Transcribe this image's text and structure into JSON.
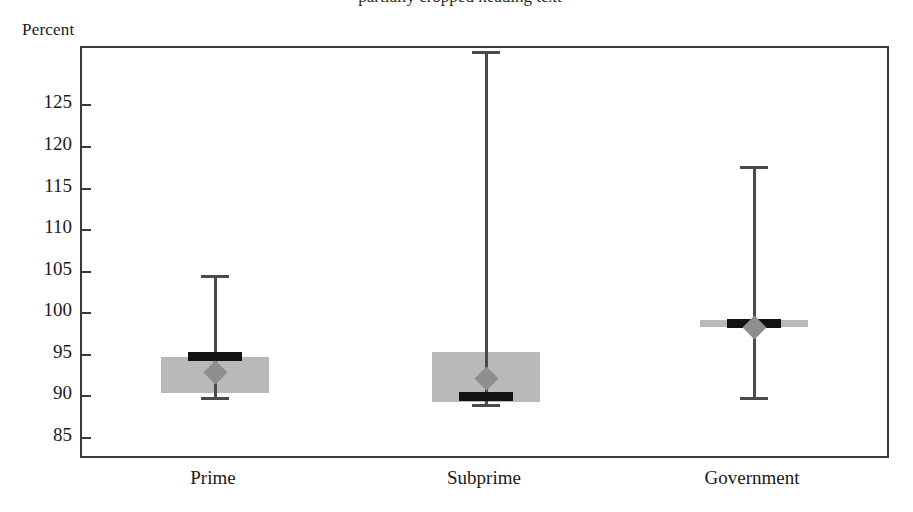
{
  "figure": {
    "title_remnant": "partially cropped heading text",
    "y_unit_label": "Percent"
  },
  "chart_data": {
    "type": "box",
    "title": "",
    "subtitle": "",
    "xlabel": "",
    "ylabel": "Percent",
    "ylim": [
      82.2,
      131.8
    ],
    "yticks": [
      85,
      90,
      95,
      100,
      105,
      110,
      115,
      120,
      125
    ],
    "ytick_labels": [
      "85",
      "90",
      "95",
      "100",
      "105",
      "110",
      "115",
      "120",
      "125"
    ],
    "grid": false,
    "legend": null,
    "categories": [
      "Prime",
      "Subprime",
      "Government"
    ],
    "box_fill_color": "#b9b9b9",
    "median_color": "#121212",
    "mean_marker_color": "#8e8e8e",
    "mean_marker_shape": "diamond",
    "whisker_color": "#4a4a4a",
    "frame_color": "#3a3a3a",
    "series": [
      {
        "name": "Prime",
        "whisker_low": 89.8,
        "box_low": 90.3,
        "median": 94.7,
        "box_high": 94.6,
        "whisker_high": 104.5,
        "mean": 92.7
      },
      {
        "name": "Subprime",
        "whisker_low": 89.0,
        "box_low": 89.2,
        "median": 89.9,
        "box_high": 95.2,
        "whisker_high": 131.4,
        "mean": 92.0
      },
      {
        "name": "Government",
        "whisker_low": 89.8,
        "box_low": 98.2,
        "median": 98.6,
        "box_high": 99.0,
        "whisker_high": 117.6,
        "mean": 98.2
      }
    ]
  }
}
